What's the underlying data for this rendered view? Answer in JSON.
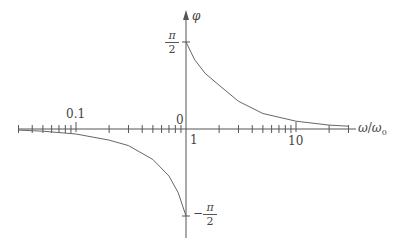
{
  "chart_data": {
    "type": "line",
    "title": "",
    "xlabel": "ω/ω₀",
    "ylabel": "φ",
    "xscale": "log",
    "xlim": [
      0.03,
      30
    ],
    "ylim": [
      "-π/2",
      "π/2"
    ],
    "x_tick_labels": [
      "0.1",
      "1",
      "10"
    ],
    "y_tick_labels": [
      "π/2",
      "0",
      "-π/2"
    ],
    "origin_label": "0",
    "grid": false,
    "legend": null,
    "series": [
      {
        "name": "phase (ω < ω₀)",
        "x": [
          0.03,
          0.05,
          0.1,
          0.2,
          0.3,
          0.5,
          0.7,
          0.85,
          1.0
        ],
        "y_rad": [
          -0.02,
          -0.04,
          -0.09,
          -0.2,
          -0.3,
          -0.55,
          -0.85,
          -1.15,
          -1.5708
        ]
      },
      {
        "name": "phase (ω > ω₀)",
        "x": [
          1.0,
          1.2,
          1.5,
          2,
          3,
          5,
          10,
          20,
          30
        ],
        "y_rad": [
          1.5708,
          1.25,
          1.0,
          0.79,
          0.5,
          0.28,
          0.14,
          0.07,
          0.05
        ]
      }
    ]
  },
  "labels": {
    "y_axis": "φ",
    "x_axis_num": "ω",
    "x_axis_den": "ω",
    "x_axis_sub": "0",
    "tick_01": "0.1",
    "tick_1": "1",
    "tick_10": "10",
    "origin": "0",
    "pi": "π",
    "two": "2",
    "minus": "−"
  }
}
